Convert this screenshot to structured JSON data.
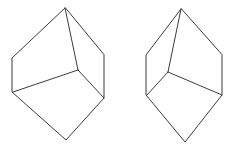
{
  "scene": {
    "title": "Mental rotation figure pair",
    "background_color": "#ffffff",
    "stroke_color": "#3b3b3b",
    "stroke_width": 1,
    "width": 246,
    "height": 154,
    "figure_count": 2
  },
  "figures": [
    {
      "id": "left-figure",
      "label": "Left figure",
      "description": "Hexagonal block outline with three internal edges meeting at a central junction",
      "outline_points": "65,8 12,58 12,92 66,140 104,98 104,55",
      "internal_edges": [
        {
          "name": "apex-to-center",
          "points": "65,8 78,70"
        },
        {
          "name": "center-to-left",
          "points": "78,70 13,92"
        },
        {
          "name": "center-to-right",
          "points": "78,70 104,98"
        }
      ],
      "vertices": [
        {
          "name": "apex",
          "x": 65,
          "y": 8
        },
        {
          "name": "upper-left",
          "x": 12,
          "y": 58
        },
        {
          "name": "lower-left",
          "x": 12,
          "y": 92
        },
        {
          "name": "bottom",
          "x": 66,
          "y": 140
        },
        {
          "name": "lower-right",
          "x": 104,
          "y": 98
        },
        {
          "name": "upper-right",
          "x": 104,
          "y": 55
        },
        {
          "name": "center-junction",
          "x": 78,
          "y": 70
        }
      ]
    },
    {
      "id": "right-figure",
      "label": "Right figure",
      "description": "Mirror image of the left figure, hexagonal block outline with three internal edges",
      "outline_points": "181,9 146,55 146,95 185,142 222,95 222,55",
      "internal_edges": [
        {
          "name": "apex-to-center",
          "points": "181,9 168,72"
        },
        {
          "name": "center-to-left",
          "points": "168,72 147,95"
        },
        {
          "name": "center-to-right",
          "points": "168,72 222,95"
        }
      ],
      "vertices": [
        {
          "name": "apex",
          "x": 181,
          "y": 9
        },
        {
          "name": "upper-left",
          "x": 146,
          "y": 55
        },
        {
          "name": "lower-left",
          "x": 146,
          "y": 95
        },
        {
          "name": "bottom",
          "x": 185,
          "y": 142
        },
        {
          "name": "lower-right",
          "x": 222,
          "y": 95
        },
        {
          "name": "upper-right",
          "x": 222,
          "y": 55
        },
        {
          "name": "center-junction",
          "x": 168,
          "y": 72
        }
      ]
    }
  ]
}
